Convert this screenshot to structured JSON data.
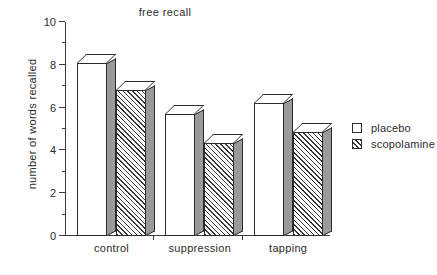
{
  "chart_data": {
    "type": "bar",
    "title": "free recall",
    "xlabel": "",
    "ylabel": "number of words recalled",
    "categories": [
      "control",
      "suppression",
      "tapping"
    ],
    "series": [
      {
        "name": "placebo",
        "values": [
          8.1,
          5.7,
          6.2
        ]
      },
      {
        "name": "scopolamine",
        "values": [
          6.8,
          4.35,
          4.85
        ]
      }
    ],
    "ylim": [
      0,
      10
    ],
    "ytick_labels": [
      "0",
      "2",
      "4",
      "6",
      "8",
      "10"
    ],
    "ytick_values": [
      0,
      2,
      4,
      6,
      8,
      10
    ],
    "yminor_values": [
      1,
      3,
      5,
      7,
      9
    ],
    "grid": false,
    "legend_position": "right",
    "legend": [
      {
        "label": "placebo",
        "swatch": "white"
      },
      {
        "label": "scopolamine",
        "swatch": "hatched"
      }
    ],
    "style": "pseudo-3d bars, hatched second series"
  },
  "colors": {
    "axis": "#3a3a3a",
    "bar_outline": "#2b2b2b",
    "bar_face": "#ffffff",
    "bar_side_shadow": "#9a9a9a",
    "hatch": "#3a3a3a",
    "text": "#2a2a2a",
    "background": "#ffffff"
  }
}
